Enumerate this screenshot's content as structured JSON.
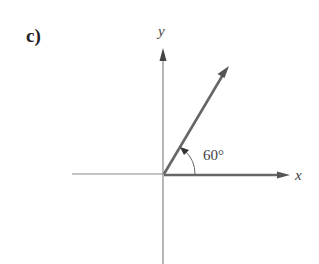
{
  "figure": {
    "part_label": "c)",
    "x_axis_label": "x",
    "y_axis_label": "y",
    "angle_label": "60°",
    "angle_degrees": 60,
    "colors": {
      "axis": "#777777",
      "vector": "#555555",
      "text": "#444444"
    }
  }
}
